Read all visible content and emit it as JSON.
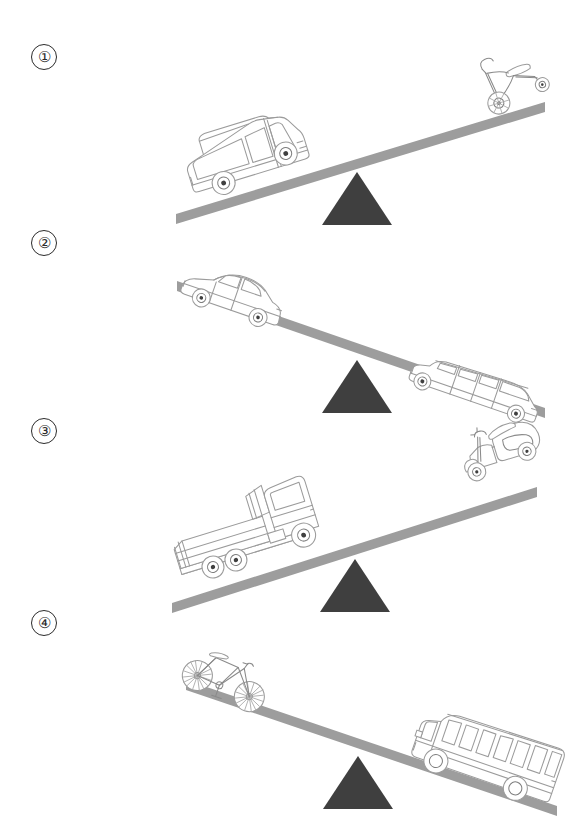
{
  "document": {
    "type": "worksheet-diagram",
    "title": "",
    "background_color": "#ffffff",
    "page_width": 582,
    "page_height": 831
  },
  "colors": {
    "beam": "#9d9d9d",
    "fulcrum": "#3f3f3f",
    "vehicle_outline": "#9b9b9b",
    "label_text": "#2b2b2b",
    "paper": "#ffffff"
  },
  "panels": [
    {
      "label": "①",
      "number": "1",
      "left": {
        "vehicle": "van",
        "position": "low",
        "side": "left",
        "heavier": true
      },
      "right": {
        "vehicle": "tricycle",
        "position": "high",
        "side": "right",
        "heavier": false
      },
      "tilt": "left-down"
    },
    {
      "label": "②",
      "number": "2",
      "left": {
        "vehicle": "sedan-car",
        "position": "high",
        "side": "left",
        "heavier": false
      },
      "right": {
        "vehicle": "limousine",
        "position": "low",
        "side": "right",
        "heavier": true
      },
      "tilt": "right-down"
    },
    {
      "label": "③",
      "number": "3",
      "left": {
        "vehicle": "cargo-truck",
        "position": "low",
        "side": "left",
        "heavier": true
      },
      "right": {
        "vehicle": "motor-scooter",
        "position": "high",
        "side": "right",
        "heavier": false
      },
      "tilt": "left-down"
    },
    {
      "label": "④",
      "number": "4",
      "left": {
        "vehicle": "bicycle",
        "position": "high",
        "side": "left",
        "heavier": false
      },
      "right": {
        "vehicle": "school-bus",
        "position": "low",
        "side": "right",
        "heavier": true
      },
      "tilt": "right-down"
    }
  ]
}
